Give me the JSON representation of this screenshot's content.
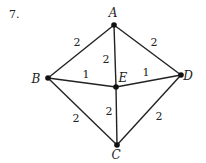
{
  "problem_number": "7.",
  "graph": {
    "nodes": [
      {
        "id": "A",
        "label": "A"
      },
      {
        "id": "B",
        "label": "B"
      },
      {
        "id": "C",
        "label": "C"
      },
      {
        "id": "D",
        "label": "D"
      },
      {
        "id": "E",
        "label": "E"
      }
    ],
    "edges": [
      {
        "from": "A",
        "to": "B",
        "weight": "2"
      },
      {
        "from": "A",
        "to": "D",
        "weight": "2"
      },
      {
        "from": "A",
        "to": "E",
        "weight": "2"
      },
      {
        "from": "B",
        "to": "E",
        "weight": "1"
      },
      {
        "from": "E",
        "to": "D",
        "weight": "1"
      },
      {
        "from": "B",
        "to": "C",
        "weight": "2"
      },
      {
        "from": "E",
        "to": "C",
        "weight": "2"
      },
      {
        "from": "D",
        "to": "C",
        "weight": "2"
      }
    ]
  }
}
